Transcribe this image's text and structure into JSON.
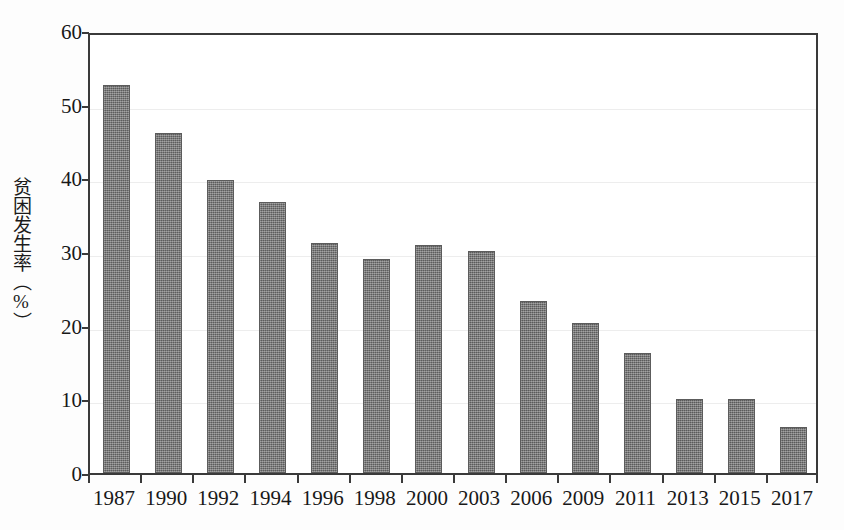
{
  "chart_data": {
    "type": "bar",
    "title": "",
    "subtitle": "",
    "xlabel": "",
    "ylabel": "贫困发生率（%）",
    "categories": [
      "1987",
      "1990",
      "1992",
      "1994",
      "1996",
      "1998",
      "2000",
      "2003",
      "2006",
      "2009",
      "2011",
      "2013",
      "2015",
      "2017"
    ],
    "values": [
      52.7,
      46.1,
      39.8,
      36.8,
      31.2,
      29.0,
      31.0,
      30.2,
      23.3,
      20.3,
      16.3,
      10.0,
      10.0,
      6.2
    ],
    "series": [
      {
        "name": "贫困发生率",
        "values": [
          52.7,
          46.1,
          39.8,
          36.8,
          31.2,
          29.0,
          31.0,
          30.2,
          23.3,
          20.3,
          16.3,
          10.0,
          10.0,
          6.2
        ]
      }
    ],
    "ylim": [
      0,
      60
    ],
    "yticks": [
      0,
      10,
      20,
      30,
      40,
      50,
      60
    ],
    "ytick_labels": [
      "0",
      "10",
      "20",
      "30",
      "40",
      "50",
      "60"
    ],
    "grid": true,
    "grid_axis": "y",
    "legend": false,
    "legend_position": "none",
    "annotations": [],
    "bar_color": "#6e6e6e",
    "axis_color": "#3a3a3a",
    "grid_color": "#ededed",
    "background_color": "#ffffff"
  },
  "axes": {
    "y_title": "贫困发生率（%）",
    "y_tick_labels": [
      "60",
      "50",
      "40",
      "30",
      "20",
      "10",
      "0"
    ],
    "x_tick_labels": [
      "1987",
      "1990",
      "1992",
      "1994",
      "1996",
      "1998",
      "2000",
      "2003",
      "2006",
      "2009",
      "2011",
      "2013",
      "2015",
      "2017"
    ]
  }
}
